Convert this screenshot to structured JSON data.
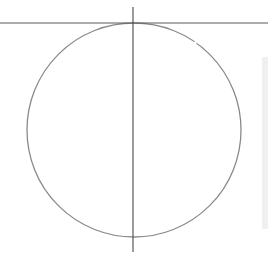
{
  "diagram": {
    "type": "circle-with-axes",
    "canvas": {
      "width": 268,
      "height": 264
    },
    "circle": {
      "cx": 134,
      "cy": 130,
      "r": 107,
      "stroke": "#8a8a8a",
      "stroke_width": 1.3
    },
    "horizontal_line": {
      "x1": 0,
      "y1": 23,
      "x2": 268,
      "y2": 23,
      "stroke": "#5a5a5a",
      "stroke_width": 1.2
    },
    "vertical_line": {
      "x1": 133,
      "y1": 7,
      "x2": 133,
      "y2": 252,
      "stroke": "#4a4a4a",
      "stroke_width": 1.1
    },
    "arc_gaps": [
      {
        "x": 77,
        "y": 42
      },
      {
        "x": 195,
        "y": 43
      }
    ],
    "side_panel": {
      "color": "#f0f0f0"
    }
  }
}
